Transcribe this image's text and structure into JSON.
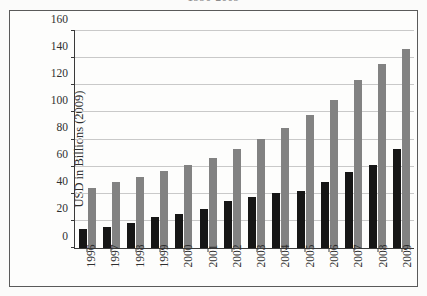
{
  "figure": {
    "title_partial": "1996-2009",
    "frame_border_color": "#5a5a5a"
  },
  "chart_data": {
    "type": "bar",
    "title": "1996-2009",
    "xlabel": "",
    "ylabel": "USD in Billions (2009)",
    "ylim": [
      0,
      160
    ],
    "ytick_values": [
      0,
      20,
      40,
      60,
      80,
      100,
      120,
      140,
      160
    ],
    "ytick_labels": [
      "0",
      "20",
      "40",
      "60",
      "80",
      "100",
      "120",
      "140",
      "160"
    ],
    "grid": true,
    "legend": "none",
    "categories": [
      "1996",
      "1997",
      "1998",
      "1999",
      "2000",
      "2001",
      "2002",
      "2003",
      "2004",
      "2005",
      "2006",
      "2007",
      "2008",
      "2009"
    ],
    "series": [
      {
        "name": "series-1",
        "color": "#161616",
        "values": [
          14,
          15.5,
          18.5,
          22.5,
          24.8,
          29,
          34.5,
          37.5,
          40.5,
          42,
          49,
          56,
          61,
          73
        ]
      },
      {
        "name": "series-2",
        "color": "#828282",
        "values": [
          44,
          48.5,
          52,
          56.5,
          61.5,
          66.5,
          73,
          80.5,
          88.5,
          98,
          109,
          124,
          136,
          147
        ]
      }
    ]
  }
}
